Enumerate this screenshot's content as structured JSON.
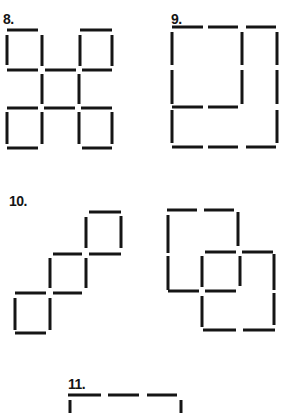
{
  "puzzles": [
    {
      "id": "8",
      "label": "8.",
      "label_pos": [
        3,
        12
      ],
      "sticks": [
        [
          7,
          30,
          38,
          30
        ],
        [
          80,
          30,
          112,
          30
        ],
        [
          7,
          35,
          7,
          65
        ],
        [
          42,
          35,
          42,
          66
        ],
        [
          80,
          35,
          80,
          66
        ],
        [
          112,
          35,
          112,
          66
        ],
        [
          7,
          70,
          38,
          70
        ],
        [
          45,
          70,
          76,
          70
        ],
        [
          82,
          70,
          112,
          70
        ],
        [
          42,
          74,
          42,
          104
        ],
        [
          79,
          74,
          79,
          104
        ],
        [
          7,
          108,
          38,
          108
        ],
        [
          44,
          108,
          75,
          108
        ],
        [
          81,
          108,
          112,
          108
        ],
        [
          7,
          112,
          7,
          144
        ],
        [
          42,
          112,
          42,
          144
        ],
        [
          79,
          112,
          79,
          144
        ],
        [
          112,
          112,
          112,
          144
        ],
        [
          7,
          148,
          38,
          148
        ],
        [
          82,
          148,
          112,
          148
        ]
      ]
    },
    {
      "id": "9",
      "label": "9.",
      "label_pos": [
        171,
        12
      ],
      "sticks": [
        [
          172,
          27,
          203,
          27
        ],
        [
          208,
          27,
          238,
          27
        ],
        [
          246,
          27,
          276,
          27
        ],
        [
          172,
          32,
          172,
          65
        ],
        [
          242,
          32,
          242,
          65
        ],
        [
          277,
          32,
          277,
          65
        ],
        [
          172,
          70,
          172,
          104
        ],
        [
          242,
          70,
          242,
          104
        ],
        [
          277,
          70,
          277,
          104
        ],
        [
          172,
          107,
          203,
          107
        ],
        [
          208,
          107,
          238,
          107
        ],
        [
          172,
          110,
          172,
          143
        ],
        [
          277,
          110,
          277,
          143
        ],
        [
          172,
          147,
          203,
          147
        ],
        [
          208,
          147,
          238,
          147
        ],
        [
          246,
          147,
          276,
          147
        ]
      ]
    },
    {
      "id": "10",
      "label": "10.",
      "label_pos": [
        9,
        194
      ],
      "sticks": [
        [
          89,
          212,
          121,
          212
        ],
        [
          86,
          217,
          86,
          248
        ],
        [
          121,
          216,
          121,
          248
        ],
        [
          53,
          254,
          82,
          254
        ],
        [
          89,
          254,
          121,
          254
        ],
        [
          50,
          258,
          50,
          288
        ],
        [
          86,
          258,
          86,
          288
        ],
        [
          15,
          293,
          46,
          293
        ],
        [
          53,
          293,
          82,
          293
        ],
        [
          15,
          298,
          15,
          330
        ],
        [
          50,
          298,
          50,
          330
        ],
        [
          15,
          333,
          46,
          333
        ]
      ]
    },
    {
      "id": "10b",
      "label": "",
      "label_pos": [
        0,
        0
      ],
      "sticks": [
        [
          167,
          210,
          197,
          210
        ],
        [
          204,
          210,
          234,
          210
        ],
        [
          168,
          215,
          168,
          253
        ],
        [
          238,
          212,
          238,
          246
        ],
        [
          205,
          252,
          236,
          252
        ],
        [
          242,
          252,
          273,
          252
        ],
        [
          168,
          256,
          168,
          290
        ],
        [
          202,
          256,
          202,
          287
        ],
        [
          240,
          256,
          240,
          286
        ],
        [
          274,
          254,
          274,
          290
        ],
        [
          168,
          291,
          199,
          291
        ],
        [
          205,
          291,
          236,
          291
        ],
        [
          202,
          296,
          202,
          327
        ],
        [
          274,
          293,
          274,
          325
        ],
        [
          203,
          330,
          236,
          330
        ],
        [
          243,
          330,
          275,
          330
        ]
      ]
    },
    {
      "id": "11",
      "label": "11.",
      "label_pos": [
        68,
        377
      ],
      "sticks": [
        [
          68,
          395,
          101,
          395
        ],
        [
          108,
          395,
          139,
          395
        ],
        [
          147,
          395,
          177,
          395
        ],
        [
          70,
          400,
          70,
          413
        ],
        [
          181,
          400,
          181,
          413
        ]
      ]
    }
  ],
  "colors": {
    "ink": "#151515",
    "paper": "#ffffff"
  }
}
